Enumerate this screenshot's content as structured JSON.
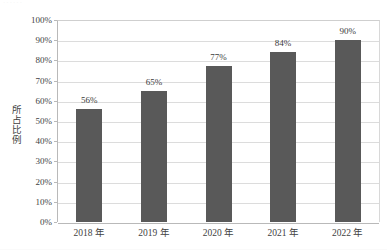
{
  "page": {
    "scan_artifact_text": "······"
  },
  "chart_data": {
    "type": "bar",
    "title": "",
    "subtitle": "",
    "xlabel": "",
    "ylabel": "所占比例",
    "categories": [
      "2018 年",
      "2019 年",
      "2020 年",
      "2021 年",
      "2022 年"
    ],
    "values": [
      56,
      65,
      77,
      84,
      90
    ],
    "value_labels": [
      "56%",
      "65%",
      "77%",
      "84%",
      "90%"
    ],
    "ylim": [
      0,
      100
    ],
    "ytick_step": 10,
    "ytick_labels": [
      "100%",
      "90%",
      "80%",
      "70%",
      "60%",
      "50%",
      "40%",
      "30%",
      "20%",
      "10%",
      "0%"
    ],
    "ytick_values": [
      100,
      90,
      80,
      70,
      60,
      50,
      40,
      30,
      20,
      10,
      0
    ],
    "grid": true,
    "legend": false,
    "legend_position": "none",
    "series": [
      {
        "name": "所占比例",
        "values": [
          56,
          65,
          77,
          84,
          90
        ],
        "color": "#595959"
      }
    ],
    "colors": {
      "bar": "#595959",
      "gridline": "#dcdcdc",
      "axis": "#b9b9b9",
      "text": "#3f3f3f",
      "background": "#ffffff"
    }
  }
}
